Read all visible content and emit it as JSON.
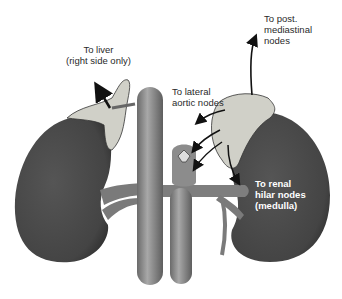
{
  "diagram": {
    "structures": [
      "right-kidney",
      "left-kidney",
      "right-adrenal-gland",
      "left-adrenal-gland",
      "inferior-vena-cava",
      "aorta",
      "renal-vessels"
    ],
    "labels": {
      "liver": "To liver\n(right side only)",
      "lateral_aortic": "To lateral\naortic nodes",
      "post_mediastinal": "To post.\nmediastinal\nnodes",
      "renal_hilar": "To renal\nhilar nodes\n(medulla)"
    },
    "colors": {
      "kidney": "#4a4a4a",
      "adrenal": "#cfcfc8",
      "vessel": "#8a8a8a",
      "arrow": "#111111",
      "text": "#2a2a2a",
      "label_on_dark": "#ffffff"
    }
  }
}
